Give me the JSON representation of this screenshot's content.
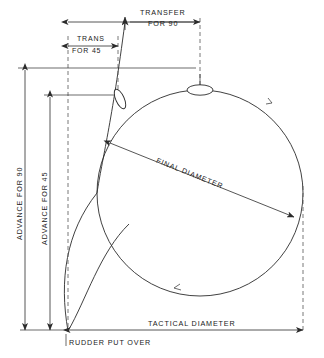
{
  "diagram": {
    "labels": {
      "transfer_for_90": "TRANSFER",
      "transfer_for_90_line2": "FOR 90",
      "trans_for_45": "TRANS",
      "trans_for_45_line2": "FOR 45",
      "advance_for_90": "ADVANCE FOR 90",
      "advance_for_45": "ADVANCE FOR 45",
      "final_diameter": "FINAL DIAMETER",
      "tactical_diameter": "TACTICAL DIAMETER",
      "rudder_put_over": "RUDDER PUT OVER"
    },
    "colors": {
      "ink": "#2b2b2b",
      "dashed": "#555555",
      "background": "#ffffff"
    },
    "ship_symbols": [
      {
        "name": "ship-at-90-degrees",
        "angle": 0
      },
      {
        "name": "ship-at-45-degrees",
        "angle": 55
      }
    ],
    "direction_arrows": 2
  }
}
